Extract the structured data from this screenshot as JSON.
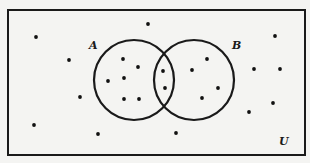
{
  "diagram": {
    "type": "venn",
    "universe_label": "U",
    "sets": [
      {
        "label": "A",
        "cx": 134,
        "cy": 80,
        "r": 40,
        "label_x": 89,
        "label_y": 49
      },
      {
        "label": "B",
        "cx": 194,
        "cy": 80,
        "r": 40,
        "label_x": 232,
        "label_y": 49
      }
    ],
    "universe_label_pos": {
      "x": 279,
      "y": 145
    },
    "frame": {
      "x": 8,
      "y": 10,
      "width": 297,
      "height": 145
    },
    "colors": {
      "stroke": "#1a1a1a",
      "background": "#f4f4f2",
      "dot": "#111111"
    },
    "regions": {
      "A_only": [
        [
          123,
          59
        ],
        [
          138,
          67
        ],
        [
          108,
          81
        ],
        [
          124,
          78
        ],
        [
          124,
          99
        ],
        [
          139,
          99
        ]
      ],
      "A_and_B": [
        [
          163,
          71
        ],
        [
          165,
          88
        ]
      ],
      "B_only": [
        [
          207,
          59
        ],
        [
          192,
          70
        ],
        [
          218,
          88
        ],
        [
          202,
          98
        ]
      ],
      "outside": [
        [
          36,
          37
        ],
        [
          148,
          24
        ],
        [
          69,
          60
        ],
        [
          275,
          36
        ],
        [
          254,
          69
        ],
        [
          280,
          69
        ],
        [
          80,
          97
        ],
        [
          34,
          125
        ],
        [
          98,
          134
        ],
        [
          273,
          103
        ],
        [
          249,
          112
        ],
        [
          176,
          133
        ]
      ]
    },
    "counts": {
      "A_only": 6,
      "A_and_B": 2,
      "B_only": 4,
      "outside": 12,
      "total": 24
    }
  }
}
